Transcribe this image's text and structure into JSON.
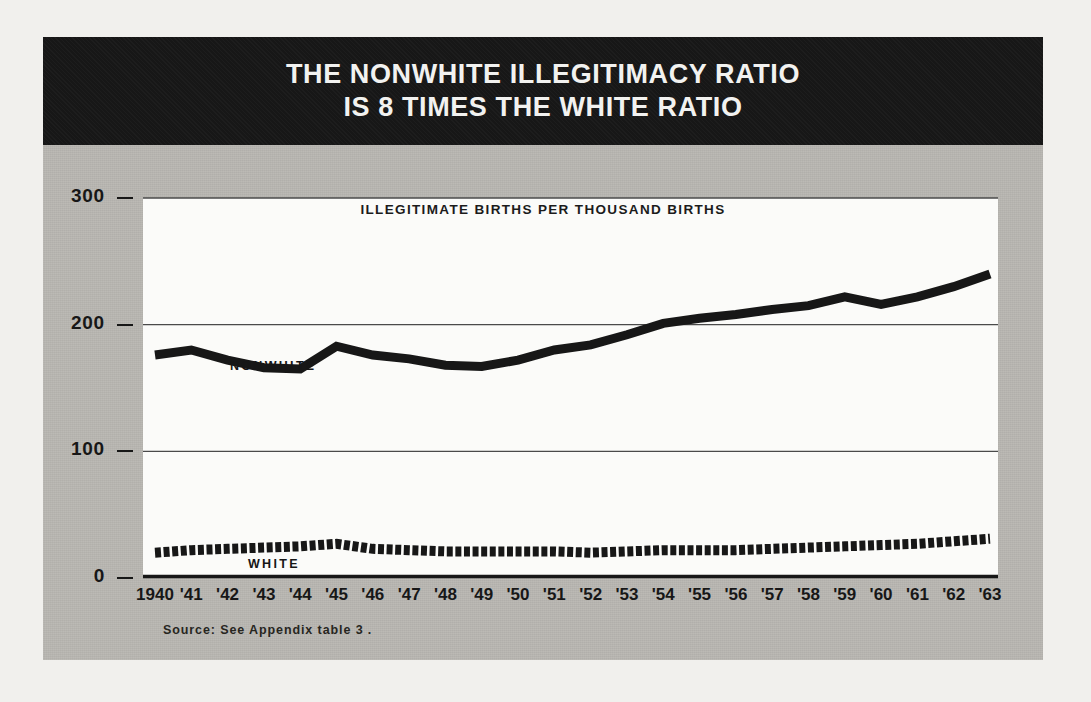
{
  "figure": {
    "title_lines": [
      "THE NONWHITE ILLEGITIMACY RATIO",
      "IS 8 TIMES THE WHITE RATIO"
    ],
    "source_note": "Source: See Appendix table 3 .",
    "colors": {
      "paper_background": "#f1f0ed",
      "panel_background": "#b9b7b2",
      "title_band": "#171717",
      "plot_background": "#fbfbf9",
      "ink": "#171717",
      "gridline": "#4a4a4a"
    }
  },
  "chart_data": {
    "type": "line",
    "title": "THE NONWHITE ILLEGITIMACY RATIO IS 8 TIMES THE WHITE RATIO",
    "subtitle": "ILLEGITIMATE BIRTHS PER THOUSAND BIRTHS",
    "xlabel": "",
    "ylabel": "ILLEGITIMATE BIRTHS PER THOUSAND BIRTHS",
    "ylim": [
      0,
      300
    ],
    "yticks": [
      0,
      100,
      200,
      300
    ],
    "ytick_labels": [
      "0",
      "100",
      "200",
      "300"
    ],
    "grid": "horizontal",
    "legend": "inline-labels",
    "x": [
      1940,
      1941,
      1942,
      1943,
      1944,
      1945,
      1946,
      1947,
      1948,
      1949,
      1950,
      1951,
      1952,
      1953,
      1954,
      1955,
      1956,
      1957,
      1958,
      1959,
      1960,
      1961,
      1962,
      1963
    ],
    "xtick_labels": [
      "1940",
      "'41",
      "'42",
      "'43",
      "'44",
      "'45",
      "'46",
      "'47",
      "'48",
      "'49",
      "'50",
      "'51",
      "'52",
      "'53",
      "'54",
      "'55",
      "'56",
      "'57",
      "'58",
      "'59",
      "'60",
      "'61",
      "'62",
      "'63"
    ],
    "series": [
      {
        "name": "NONWHITE",
        "style": "solid-thick",
        "label_x_index": 3,
        "values": [
          176,
          180,
          172,
          166,
          165,
          183,
          176,
          173,
          168,
          167,
          172,
          180,
          184,
          192,
          201,
          205,
          208,
          212,
          215,
          222,
          216,
          222,
          230,
          240
        ]
      },
      {
        "name": "WHITE",
        "style": "dashed-thick",
        "label_x_index": 3,
        "values": [
          20,
          22,
          23,
          24,
          25,
          27,
          23,
          22,
          21,
          21,
          21,
          21,
          20,
          21,
          22,
          22,
          22,
          23,
          24,
          25,
          26,
          27,
          29,
          31
        ]
      }
    ]
  }
}
